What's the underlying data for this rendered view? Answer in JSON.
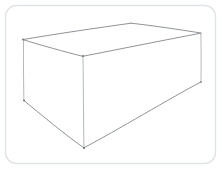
{
  "canvas": {
    "width": 222,
    "height": 170,
    "background_color": "#ffffff",
    "title": "",
    "frame": {
      "name": "rounded-frame",
      "x": 5.5,
      "y": 5.5,
      "width": 210,
      "height": 158,
      "radius": 11,
      "stroke_color": "#dfe4e6",
      "fill_color": "#ffffff",
      "stroke_width": 1.4
    }
  },
  "sketch": {
    "type": "wireframe-cuboid",
    "description": "Hand-drawn line drawing of a rectangular box (cuboid) shown in three-quarter view with top, front-left and right faces visible.",
    "stroke_color": "#7b7f85",
    "stroke_color_faint": "#9aa0a6",
    "stroke_width": 0.85,
    "vertices": {
      "top_back_left": {
        "x": 23,
        "y": 39.5
      },
      "top_back_apex": {
        "x": 131,
        "y": 23
      },
      "top_back_right": {
        "x": 201,
        "y": 33
      },
      "top_front_center": {
        "x": 83,
        "y": 56
      },
      "bottom_front_left": {
        "x": 24,
        "y": 100.5
      },
      "bottom_front_center": {
        "x": 84,
        "y": 148
      },
      "bottom_back_right": {
        "x": 201,
        "y": 82
      }
    },
    "paths": {
      "top_face_back_left_edge": "M 23.5 39.5 C 52 34.5, 100 27.5, 131 23.2",
      "top_face_back_right_edge": "M 131 23.2 C 152 25.4, 182 30, 200.8 33",
      "top_face_front_left_edge": "M 23.5 39.8 C 38 44.4, 66 52.2, 82.8 56.3",
      "top_face_front_right_edge": "M 82.8 56.3 C 116 49.8, 171 38.8, 200.8 33.2",
      "left_vertical_edge": "M 23.6 39.8 C 23.2 58, 23.6 82, 23.9 100.4",
      "center_vertical_edge": "M 83.0 56.4 C 83.3 84, 83.6 122, 83.9 147.7",
      "right_vertical_edge": "M 200.9 33.3 C 201.2 50, 201.1 68, 201.0 81.8",
      "bottom_left_edge": "M 23.9 100.5 C 39 113, 68 137, 83.9 147.8",
      "bottom_right_edge": "M 83.9 147.8 C 116 131, 172 97, 200.9 82.0"
    }
  },
  "annotations": {
    "labels": [],
    "dimension_text": "",
    "caption": ""
  }
}
